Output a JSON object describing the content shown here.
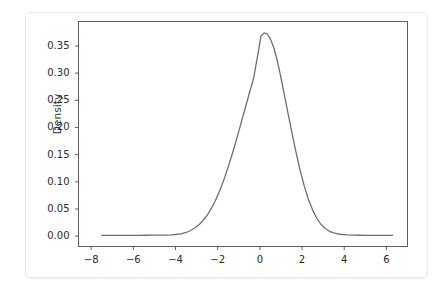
{
  "chart_data": {
    "type": "line",
    "title": "",
    "xlabel": "",
    "ylabel": "Density",
    "xlim": [
      -8.6,
      7.0
    ],
    "ylim": [
      -0.019,
      0.395
    ],
    "xticks": [
      -8,
      -6,
      -4,
      -2,
      0,
      2,
      4,
      6
    ],
    "xtick_labels": [
      "−8",
      "−6",
      "−4",
      "−2",
      "0",
      "2",
      "4",
      "6"
    ],
    "yticks": [
      0.0,
      0.05,
      0.1,
      0.15,
      0.2,
      0.25,
      0.3,
      0.35
    ],
    "ytick_labels": [
      "0.00",
      "0.05",
      "0.10",
      "0.15",
      "0.20",
      "0.25",
      "0.30",
      "0.35"
    ],
    "grid": false,
    "legend": null,
    "line_color": "#6e6e6e",
    "line_width": 1.3,
    "series": [
      {
        "name": "Density",
        "x": [
          -7.5,
          -7.2,
          -6.9,
          -6.6,
          -6.3,
          -6.0,
          -5.7,
          -5.4,
          -5.1,
          -4.8,
          -4.5,
          -4.2,
          -3.9,
          -3.7,
          -3.5,
          -3.3,
          -3.1,
          -2.9,
          -2.7,
          -2.5,
          -2.3,
          -2.1,
          -1.9,
          -1.7,
          -1.5,
          -1.3,
          -1.1,
          -0.9,
          -0.7,
          -0.5,
          -0.3,
          -0.1,
          0.05,
          0.2,
          0.35,
          0.5,
          0.65,
          0.8,
          0.95,
          1.1,
          1.3,
          1.5,
          1.7,
          1.9,
          2.1,
          2.3,
          2.5,
          2.7,
          2.9,
          3.1,
          3.3,
          3.5,
          3.8,
          4.1,
          4.4,
          4.7,
          5.0,
          5.4,
          5.8,
          6.3
        ],
        "y": [
          0.0015,
          0.0015,
          0.0015,
          0.0015,
          0.0015,
          0.0016,
          0.0016,
          0.0017,
          0.0018,
          0.0019,
          0.0021,
          0.0025,
          0.0035,
          0.0048,
          0.0068,
          0.01,
          0.0145,
          0.0205,
          0.0285,
          0.0385,
          0.051,
          0.066,
          0.084,
          0.1045,
          0.1275,
          0.1525,
          0.179,
          0.207,
          0.235,
          0.263,
          0.29,
          0.333,
          0.368,
          0.374,
          0.372,
          0.363,
          0.348,
          0.327,
          0.301,
          0.272,
          0.233,
          0.194,
          0.157,
          0.123,
          0.093,
          0.068,
          0.048,
          0.033,
          0.0215,
          0.014,
          0.009,
          0.006,
          0.0035,
          0.0024,
          0.0019,
          0.0017,
          0.0016,
          0.0015,
          0.0015,
          0.0015
        ]
      }
    ]
  },
  "figure": {
    "axis_label_y": "Density",
    "background_color": "#ffffff",
    "frame_color": "#5f5f5f",
    "tick_color": "#5f5f5f"
  }
}
